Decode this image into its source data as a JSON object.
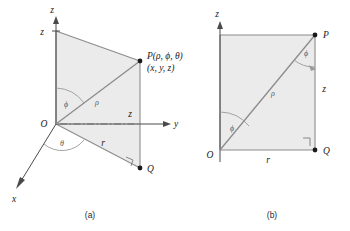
{
  "figure": {
    "title_a_caption": "(a)",
    "title_b_caption": "(b)",
    "colors": {
      "shade_fill": "#ebebeb",
      "edge_stroke": "#8c8c8c",
      "axis_stroke": "#4a4a4a",
      "arc_stroke": "#9a9a9a",
      "text": "#1a1a1a"
    }
  },
  "diagram_a": {
    "axis_z_label": "z",
    "axis_y_label": "y",
    "axis_x_label": "x",
    "tick_z_label": "z",
    "origin_label": "O",
    "point_p_label": "P(ρ, ϕ, θ)",
    "point_p_sub_label": "(x, y, z)",
    "point_q_label": "Q",
    "rho_label": "ρ",
    "r_label": "r",
    "z_side_label": "z",
    "phi_label": "ϕ",
    "theta_label": "θ"
  },
  "diagram_b": {
    "axis_z_label": "z",
    "origin_label": "O",
    "point_p_label": "P",
    "point_q_label": "Q",
    "rho_label": "ρ",
    "r_label": "r",
    "z_side_label": "z",
    "phi_label_origin": "ϕ",
    "phi_label_p": "ϕ"
  }
}
